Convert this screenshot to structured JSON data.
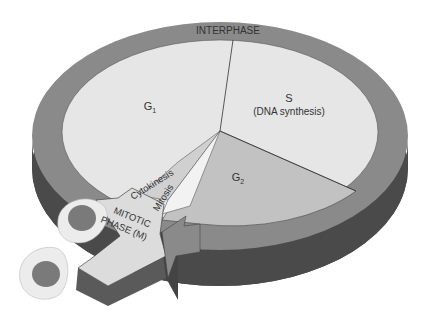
{
  "diagram": {
    "type": "cell-cycle",
    "ring_label": "INTERPHASE",
    "phases": [
      {
        "id": "g1",
        "label": "G",
        "subscript": "1"
      },
      {
        "id": "s",
        "label": "S",
        "sublabel": "(DNA synthesis)"
      },
      {
        "id": "g2",
        "label": "G",
        "subscript": "2"
      },
      {
        "id": "mitosis",
        "label": "Mitosis"
      },
      {
        "id": "cytokinesis",
        "label": "Cytokinesis"
      }
    ],
    "arrow_label_line1": "MITOTIC",
    "arrow_label_line2": "PHASE (M)",
    "colors": {
      "ring_top": "#8a8a8a",
      "ring_side": "#4a4a4a",
      "g1_s_fill": "#e6e6e6",
      "g2_fill": "#c2c2c2",
      "mitosis_fill": "#ededed",
      "cytokinesis_fill": "#d0d0d0",
      "arrow_top": "#dcdcdc",
      "arrow_side": "#5a5a5a",
      "nucleus": "#7a7a7a",
      "cell": "#ececec"
    }
  }
}
